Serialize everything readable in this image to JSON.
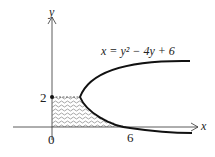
{
  "diagram": {
    "equation_label": "x = y² − 4y + 6",
    "axis_x_label": "x",
    "axis_y_label": "y",
    "tick_y_2": "2",
    "tick_x_0": "0",
    "tick_x_6": "6",
    "colors": {
      "stroke": "#222222",
      "hatch": "#555555",
      "background": "#ffffff"
    }
  }
}
